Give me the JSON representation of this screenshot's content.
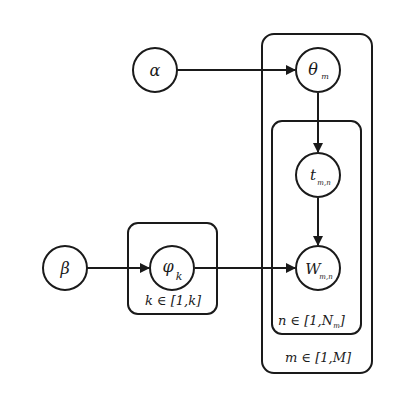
{
  "diagram": {
    "type": "plate-notation",
    "nodes": [
      {
        "id": "alpha",
        "symbol": "α",
        "sub": ""
      },
      {
        "id": "theta",
        "symbol": "θ",
        "sub": "m"
      },
      {
        "id": "t",
        "symbol": "t",
        "sub": "m,n"
      },
      {
        "id": "w",
        "symbol": "W",
        "sub": "m,n"
      },
      {
        "id": "beta",
        "symbol": "β",
        "sub": ""
      },
      {
        "id": "phi",
        "symbol": "φ",
        "sub": "k"
      }
    ],
    "edges": [
      {
        "from": "alpha",
        "to": "theta"
      },
      {
        "from": "theta",
        "to": "t"
      },
      {
        "from": "t",
        "to": "w"
      },
      {
        "from": "beta",
        "to": "phi"
      },
      {
        "from": "phi",
        "to": "w"
      }
    ],
    "plates": {
      "outer": {
        "label": "m ∈ [1,M]"
      },
      "inner": {
        "label_main": "n ∈ [1,N",
        "label_sub": "m",
        "label_close": "]"
      },
      "topic": {
        "label": "k ∈ [1,k]"
      }
    },
    "colors": {
      "stroke": "#1a1a1a",
      "background": "#ffffff"
    }
  }
}
